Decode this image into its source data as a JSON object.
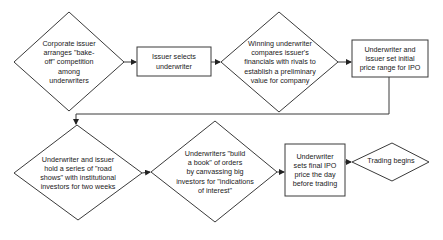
{
  "diagram": {
    "type": "flowchart",
    "colors": {
      "stroke": "#3a3a3a",
      "fill": "#ffffff",
      "text": "#1a1a1a",
      "background": "#ffffff"
    },
    "nodes": [
      {
        "id": "n1",
        "shape": "diamond",
        "label": "Corporate issuer\narranges \"bake-\noff\" competition\namong\nunderwriters"
      },
      {
        "id": "n2",
        "shape": "rectangle",
        "label": "Issuer selects\nunderwriter"
      },
      {
        "id": "n3",
        "shape": "diamond",
        "label": "Winning underwriter\ncompares issuer's\nfinancials with rivals to\nestablish a preliminary\nvalue for company"
      },
      {
        "id": "n4",
        "shape": "rectangle",
        "label": "Underwriter and\nissuer set initial\nprice range for IPO"
      },
      {
        "id": "n5",
        "shape": "diamond",
        "label": "Underwriter and issuer\nhold a series of \"road\nshows\" with institutional\ninvestors for two weeks"
      },
      {
        "id": "n6",
        "shape": "diamond",
        "label": "Underwriters \"build\na book\" of orders\nby canvassing big\ninvestors for \"indications\nof interest\""
      },
      {
        "id": "n7",
        "shape": "rectangle",
        "label": "Underwriter\nsets final IPO\nprice the day\nbefore trading"
      },
      {
        "id": "n8",
        "shape": "diamond",
        "label": "Trading begins"
      }
    ],
    "edges": [
      {
        "from": "n1",
        "to": "n2"
      },
      {
        "from": "n2",
        "to": "n3"
      },
      {
        "from": "n3",
        "to": "n4"
      },
      {
        "from": "n4",
        "to": "n5"
      },
      {
        "from": "n5",
        "to": "n6"
      },
      {
        "from": "n6",
        "to": "n7"
      },
      {
        "from": "n7",
        "to": "n8"
      }
    ]
  }
}
